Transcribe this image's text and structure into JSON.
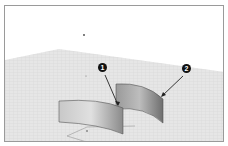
{
  "viewport": {
    "background": "#ffffff",
    "ground_color": "#e4e4e4",
    "grid_color": "#cfcfcf",
    "border_color": "#9a9a9a"
  },
  "surfaces": [
    {
      "name": "surface-1",
      "fill": "#b8b8b8"
    },
    {
      "name": "surface-2",
      "fill": "#8f8f8f"
    }
  ],
  "callouts": [
    {
      "label": "1"
    },
    {
      "label": "2"
    }
  ]
}
